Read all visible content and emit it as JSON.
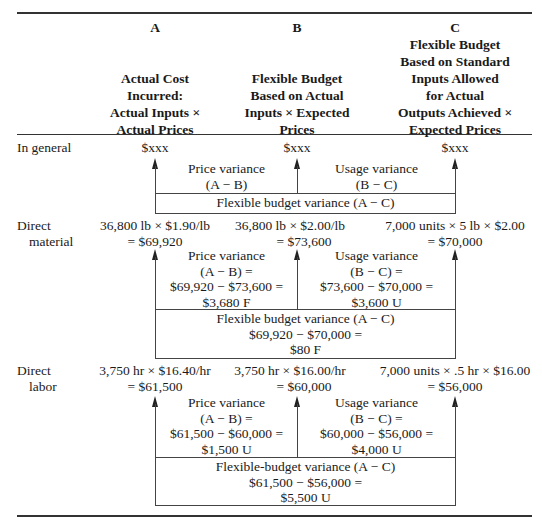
{
  "columns": [
    {
      "letter": "A",
      "lines": [
        "Actual Cost",
        "Incurred:",
        "Actual Inputs ×",
        "Actual Prices"
      ]
    },
    {
      "letter": "B",
      "lines": [
        "Flexible Budget",
        "Based on Actual",
        "Inputs × Expected",
        "Prices"
      ]
    },
    {
      "letter": "C",
      "lines": [
        "Flexible Budget",
        "Based on Standard",
        "Inputs Allowed",
        "for Actual",
        "Outputs Achieved ×",
        "Expected Prices"
      ]
    }
  ],
  "sections": [
    {
      "label": [
        "In general"
      ],
      "values": [
        [
          "$xxx"
        ],
        [
          "$xxx"
        ],
        [
          "$xxx"
        ]
      ],
      "price_variance": [
        "Price variance",
        "(A − B)"
      ],
      "usage_variance": [
        "Usage variance",
        "(B − C)"
      ],
      "flex_variance": [
        "Flexible budget variance (A − C)"
      ]
    },
    {
      "label": [
        "Direct",
        "material"
      ],
      "values": [
        [
          "36,800 lb × $1.90/lb",
          "= $69,920"
        ],
        [
          "36,800 lb × $2.00/lb",
          "= $73,600"
        ],
        [
          "7,000 units × 5 lb × $2.00",
          "= $70,000"
        ]
      ],
      "price_variance": [
        "Price variance",
        "(A − B) =",
        "$69,920 − $73,600 =",
        "$3,680 F"
      ],
      "usage_variance": [
        "Usage variance",
        "(B − C) =",
        "$73,600 − $70,000 =",
        "$3,600 U"
      ],
      "flex_variance": [
        "Flexible budget variance (A − C)",
        "$69,920 − $70,000 =",
        "$80 F"
      ]
    },
    {
      "label": [
        "Direct",
        "labor"
      ],
      "values": [
        [
          "3,750 hr × $16.40/hr",
          "= $61,500"
        ],
        [
          "3,750 hr × $16.00/hr",
          "= $60,000"
        ],
        [
          "7,000 units × .5 hr × $16.00",
          "= $56,000"
        ]
      ],
      "price_variance": [
        "Price variance",
        "(A − B) =",
        "$61,500 − $60,000 =",
        "$1,500 U"
      ],
      "usage_variance": [
        "Usage variance",
        "(B − C) =",
        "$60,000 − $56,000 =",
        "$4,000 U"
      ],
      "flex_variance": [
        "Flexible-budget variance (A − C)",
        "$61,500 − $56,000 =",
        "$5,500 U"
      ]
    }
  ]
}
